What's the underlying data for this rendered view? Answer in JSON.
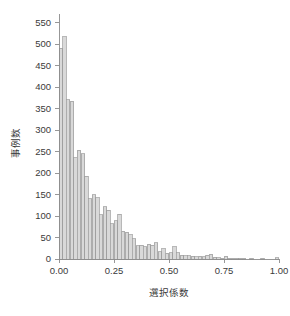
{
  "chart_data": {
    "type": "bar",
    "title": "",
    "subtitle": "",
    "xlabel": "選択係数",
    "ylabel": "事例数",
    "xlim": [
      0.0,
      1.0
    ],
    "ylim": [
      0,
      570
    ],
    "grid": false,
    "legend": null,
    "bin_width": 0.0167,
    "xticks": [
      0.0,
      0.25,
      0.5,
      0.75,
      1.0
    ],
    "xtick_labels": [
      "0.00",
      "0.25",
      "0.50",
      "0.75",
      "1.00"
    ],
    "yticks": [
      0,
      50,
      100,
      150,
      200,
      250,
      300,
      350,
      400,
      450,
      500,
      550
    ],
    "ytick_labels": [
      "0",
      "50",
      "100",
      "150",
      "200",
      "250",
      "300",
      "350",
      "400",
      "450",
      "500",
      "550"
    ],
    "bar_fill": "#d9d9d9",
    "bar_stroke": "#9a9a9a",
    "axis_color": "#8c8c8c",
    "text_color": "#3a3a3a",
    "background": "#ffffff",
    "categories": [
      "0.000",
      "0.017",
      "0.033",
      "0.050",
      "0.067",
      "0.083",
      "0.100",
      "0.117",
      "0.133",
      "0.150",
      "0.167",
      "0.183",
      "0.200",
      "0.217",
      "0.233",
      "0.250",
      "0.267",
      "0.283",
      "0.300",
      "0.317",
      "0.333",
      "0.350",
      "0.367",
      "0.383",
      "0.400",
      "0.417",
      "0.433",
      "0.450",
      "0.467",
      "0.483",
      "0.500",
      "0.517",
      "0.533",
      "0.550",
      "0.567",
      "0.583",
      "0.600",
      "0.617",
      "0.633",
      "0.650",
      "0.667",
      "0.683",
      "0.700",
      "0.717",
      "0.733",
      "0.750",
      "0.767",
      "0.783",
      "0.800",
      "0.817",
      "0.833",
      "0.850",
      "0.867",
      "0.883",
      "0.900",
      "0.917",
      "0.933",
      "0.950",
      "0.967",
      "0.983"
    ],
    "values": [
      490,
      517,
      370,
      367,
      235,
      253,
      245,
      193,
      140,
      150,
      143,
      103,
      122,
      114,
      82,
      89,
      104,
      64,
      62,
      57,
      47,
      31,
      32,
      29,
      34,
      32,
      38,
      17,
      24,
      13,
      15,
      28,
      14,
      9,
      7,
      7,
      6,
      5,
      6,
      5,
      9,
      11,
      4,
      3,
      2,
      6,
      2,
      1,
      1,
      1,
      1,
      0,
      1,
      0,
      0,
      1,
      0,
      0,
      0,
      3
    ]
  }
}
